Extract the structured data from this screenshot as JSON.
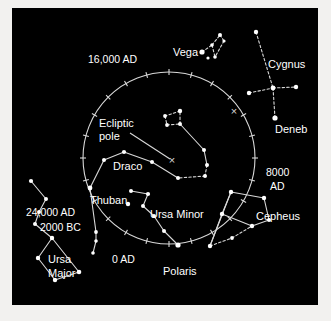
{
  "figure": {
    "type": "sky-chart",
    "title_visible": false,
    "background_color": "#000000",
    "frame_color": "#f2f1ef",
    "line_color": "#d8d8d8",
    "star_color": "#ffffff",
    "label_color": "#ffffff"
  },
  "precession_circle": {
    "name": "precession-circle",
    "center": [
      169,
      158
    ],
    "radius": 86,
    "tick_count": 24,
    "tick_length": 6
  },
  "epoch_labels": [
    {
      "id": "epoch-16000ad",
      "text": "16,000 AD",
      "x": 88,
      "y": 53,
      "align": "left"
    },
    {
      "id": "epoch-8000ad",
      "text": "8000",
      "x": 266,
      "y": 166,
      "align": "left"
    },
    {
      "id": "epoch-8000ad2",
      "text": "AD",
      "x": 270,
      "y": 180,
      "align": "left"
    },
    {
      "id": "epoch-24000ad",
      "text": "24,000 AD",
      "x": 26,
      "y": 206,
      "align": "left"
    },
    {
      "id": "epoch-2000bc",
      "text": "2000 BC",
      "x": 40,
      "y": 221,
      "align": "left"
    },
    {
      "id": "epoch-0ad",
      "text": "0 AD",
      "x": 112,
      "y": 253,
      "align": "left"
    }
  ],
  "annotations": [
    {
      "id": "ecliptic-pole-line1",
      "text": "Ecliptic",
      "x": 99,
      "y": 117
    },
    {
      "id": "ecliptic-pole-line2",
      "text": "pole",
      "x": 99,
      "y": 130
    },
    {
      "id": "marker-ecliptic-pole",
      "symbol": "×",
      "x": 172,
      "y": 160
    },
    {
      "id": "marker-cross-upper-right",
      "symbol": "×",
      "x": 234,
      "y": 111
    }
  ],
  "star_labels": [
    {
      "id": "label-vega",
      "text": "Vega",
      "x": 173,
      "y": 46
    },
    {
      "id": "label-cygnus",
      "text": "Cygnus",
      "x": 268,
      "y": 58
    },
    {
      "id": "label-deneb",
      "text": "Deneb",
      "x": 275,
      "y": 123
    },
    {
      "id": "label-draco",
      "text": "Draco",
      "x": 113,
      "y": 160
    },
    {
      "id": "label-thuban",
      "text": "Thuban",
      "x": 90,
      "y": 194
    },
    {
      "id": "label-ursa-minor",
      "text": "Ursa Minor",
      "x": 150,
      "y": 208
    },
    {
      "id": "label-cepheus",
      "text": "Cepheus",
      "x": 256,
      "y": 210
    },
    {
      "id": "label-ursa-major1",
      "text": "Ursa",
      "x": 48,
      "y": 253
    },
    {
      "id": "label-ursa-major2",
      "text": "Major",
      "x": 48,
      "y": 267
    },
    {
      "id": "label-polaris",
      "text": "Polaris",
      "x": 163,
      "y": 265
    }
  ],
  "constellations": [
    {
      "name": "lyra",
      "label": "Vega",
      "stars": [
        {
          "id": "vega",
          "x": 202,
          "y": 52,
          "r": 2.6,
          "name": "Vega"
        },
        {
          "id": "lyra-b",
          "x": 208,
          "y": 58,
          "r": 1.6
        },
        {
          "id": "lyra-c",
          "x": 212,
          "y": 45,
          "r": 1.8
        },
        {
          "id": "lyra-d",
          "x": 215,
          "y": 57,
          "r": 1.8
        },
        {
          "id": "lyra-e",
          "x": 220,
          "y": 35,
          "r": 2.0
        },
        {
          "id": "lyra-f",
          "x": 224,
          "y": 41,
          "r": 1.6
        }
      ],
      "segments": [
        {
          "from": "vega",
          "to": "lyra-c",
          "style": "dashed"
        },
        {
          "from": "lyra-c",
          "to": "lyra-d",
          "style": "dashed"
        },
        {
          "from": "lyra-c",
          "to": "lyra-e",
          "style": "dashed"
        },
        {
          "from": "lyra-e",
          "to": "lyra-f",
          "style": "dashed"
        },
        {
          "from": "lyra-f",
          "to": "lyra-d",
          "style": "dashed"
        }
      ]
    },
    {
      "name": "cygnus",
      "label": "Cygnus",
      "stars": [
        {
          "id": "cyg-top",
          "x": 256,
          "y": 32,
          "r": 2.2
        },
        {
          "id": "cyg-mid",
          "x": 273,
          "y": 88,
          "r": 2.4
        },
        {
          "id": "cyg-left",
          "x": 249,
          "y": 93,
          "r": 2.2
        },
        {
          "id": "cyg-right",
          "x": 296,
          "y": 87,
          "r": 2.2
        },
        {
          "id": "deneb",
          "x": 275,
          "y": 118,
          "r": 2.6,
          "name": "Deneb"
        }
      ],
      "segments": [
        {
          "from": "cyg-top",
          "to": "cyg-mid",
          "style": "dashed"
        },
        {
          "from": "cyg-mid",
          "to": "deneb",
          "style": "dashed"
        },
        {
          "from": "cyg-left",
          "to": "cyg-mid",
          "style": "dashed"
        },
        {
          "from": "cyg-mid",
          "to": "cyg-right",
          "style": "dashed"
        }
      ]
    },
    {
      "name": "draco",
      "label": "Draco",
      "stars": [
        {
          "id": "dra-head-a",
          "x": 180,
          "y": 111,
          "r": 2.2
        },
        {
          "id": "dra-head-b",
          "x": 165,
          "y": 116,
          "r": 1.9
        },
        {
          "id": "dra-head-c",
          "x": 167,
          "y": 125,
          "r": 1.9
        },
        {
          "id": "dra-head-d",
          "x": 180,
          "y": 124,
          "r": 2.0
        },
        {
          "id": "dra-e",
          "x": 204,
          "y": 150,
          "r": 2.0
        },
        {
          "id": "dra-f",
          "x": 207,
          "y": 165,
          "r": 2.0
        },
        {
          "id": "dra-g",
          "x": 205,
          "y": 176,
          "r": 2.0
        },
        {
          "id": "dra-h",
          "x": 178,
          "y": 178,
          "r": 2.0
        },
        {
          "id": "dra-i",
          "x": 152,
          "y": 162,
          "r": 2.0
        },
        {
          "id": "dra-j",
          "x": 124,
          "y": 152,
          "r": 2.1
        },
        {
          "id": "dra-k",
          "x": 104,
          "y": 160,
          "r": 2.0
        },
        {
          "id": "thuban",
          "x": 90,
          "y": 188,
          "r": 2.4,
          "name": "Thuban"
        },
        {
          "id": "dra-m",
          "x": 96,
          "y": 232,
          "r": 1.9
        },
        {
          "id": "dra-n",
          "x": 96,
          "y": 241,
          "r": 1.8
        },
        {
          "id": "dra-o",
          "x": 93,
          "y": 253,
          "r": 1.8
        }
      ],
      "segments": [
        {
          "from": "dra-head-a",
          "to": "dra-head-b",
          "style": "dashed"
        },
        {
          "from": "dra-head-b",
          "to": "dra-head-c",
          "style": "dashed"
        },
        {
          "from": "dra-head-c",
          "to": "dra-head-d",
          "style": "dashed"
        },
        {
          "from": "dra-head-d",
          "to": "dra-head-a",
          "style": "dashed"
        },
        {
          "from": "dra-head-d",
          "to": "dra-e",
          "style": "solid"
        },
        {
          "from": "dra-e",
          "to": "dra-f",
          "style": "solid"
        },
        {
          "from": "dra-f",
          "to": "dra-g",
          "style": "dashed"
        },
        {
          "from": "dra-g",
          "to": "dra-h",
          "style": "dashed"
        },
        {
          "from": "dra-h",
          "to": "dra-i",
          "style": "solid"
        },
        {
          "from": "dra-i",
          "to": "dra-j",
          "style": "solid"
        },
        {
          "from": "dra-j",
          "to": "dra-k",
          "style": "solid"
        },
        {
          "from": "dra-k",
          "to": "thuban",
          "style": "solid"
        },
        {
          "from": "thuban",
          "to": "dra-m",
          "style": "solid"
        },
        {
          "from": "dra-m",
          "to": "dra-n",
          "style": "solid"
        },
        {
          "from": "dra-n",
          "to": "dra-o",
          "style": "solid"
        }
      ]
    },
    {
      "name": "ursa-minor",
      "label": "Ursa Minor",
      "stars": [
        {
          "id": "umi-a",
          "x": 131,
          "y": 191,
          "r": 2.0
        },
        {
          "id": "umi-b",
          "x": 148,
          "y": 194,
          "r": 2.1
        },
        {
          "id": "umi-c",
          "x": 128,
          "y": 204,
          "r": 2.2
        },
        {
          "id": "umi-d",
          "x": 143,
          "y": 206,
          "r": 2.0
        },
        {
          "id": "umi-e",
          "x": 154,
          "y": 216,
          "r": 2.0
        },
        {
          "id": "umi-f",
          "x": 164,
          "y": 231,
          "r": 2.0
        },
        {
          "id": "polaris",
          "x": 178,
          "y": 245,
          "r": 2.6,
          "name": "Polaris"
        }
      ],
      "segments": [
        {
          "from": "umi-a",
          "to": "umi-b",
          "style": "solid"
        },
        {
          "from": "umi-b",
          "to": "umi-d",
          "style": "solid"
        },
        {
          "from": "umi-d",
          "to": "umi-e",
          "style": "solid"
        },
        {
          "from": "umi-e",
          "to": "umi-f",
          "style": "solid"
        },
        {
          "from": "umi-f",
          "to": "polaris",
          "style": "solid"
        }
      ]
    },
    {
      "name": "ursa-major",
      "label": "Ursa Major",
      "stars": [
        {
          "id": "uma-a",
          "x": 31,
          "y": 181,
          "r": 2.1
        },
        {
          "id": "uma-b",
          "x": 46,
          "y": 199,
          "r": 2.0
        },
        {
          "id": "uma-c",
          "x": 39,
          "y": 212,
          "r": 2.0
        },
        {
          "id": "uma-d",
          "x": 35,
          "y": 224,
          "r": 2.0
        },
        {
          "id": "uma-e",
          "x": 52,
          "y": 238,
          "r": 2.2
        },
        {
          "id": "uma-f",
          "x": 38,
          "y": 258,
          "r": 2.2
        },
        {
          "id": "uma-g",
          "x": 55,
          "y": 280,
          "r": 2.2
        },
        {
          "id": "uma-h",
          "x": 79,
          "y": 272,
          "r": 2.3
        }
      ],
      "segments": [
        {
          "from": "uma-a",
          "to": "uma-b",
          "style": "solid"
        },
        {
          "from": "uma-b",
          "to": "uma-c",
          "style": "solid"
        },
        {
          "from": "uma-c",
          "to": "uma-d",
          "style": "solid"
        },
        {
          "from": "uma-d",
          "to": "uma-e",
          "style": "solid"
        },
        {
          "from": "uma-e",
          "to": "uma-f",
          "style": "solid"
        },
        {
          "from": "uma-f",
          "to": "uma-g",
          "style": "solid"
        },
        {
          "from": "uma-g",
          "to": "uma-h",
          "style": "solid"
        },
        {
          "from": "uma-h",
          "to": "uma-e",
          "style": "solid"
        }
      ]
    },
    {
      "name": "cepheus",
      "label": "Cepheus",
      "stars": [
        {
          "id": "cep-a",
          "x": 231,
          "y": 192,
          "r": 2.2
        },
        {
          "id": "cep-b",
          "x": 264,
          "y": 198,
          "r": 2.2
        },
        {
          "id": "cep-c",
          "x": 222,
          "y": 214,
          "r": 2.2
        },
        {
          "id": "cep-d",
          "x": 252,
          "y": 226,
          "r": 2.2
        },
        {
          "id": "cep-e",
          "x": 269,
          "y": 220,
          "r": 2.0
        },
        {
          "id": "cep-f",
          "x": 210,
          "y": 246,
          "r": 2.2
        },
        {
          "id": "cep-g",
          "x": 232,
          "y": 238,
          "r": 1.9
        }
      ],
      "segments": [
        {
          "from": "cep-a",
          "to": "cep-b",
          "style": "solid"
        },
        {
          "from": "cep-b",
          "to": "cep-e",
          "style": "solid"
        },
        {
          "from": "cep-e",
          "to": "cep-d",
          "style": "solid"
        },
        {
          "from": "cep-a",
          "to": "cep-c",
          "style": "solid"
        },
        {
          "from": "cep-c",
          "to": "cep-d",
          "style": "solid"
        },
        {
          "from": "cep-c",
          "to": "cep-f",
          "style": "solid"
        },
        {
          "from": "cep-a",
          "to": "cep-f",
          "style": "solid"
        },
        {
          "from": "cep-f",
          "to": "cep-g",
          "style": "dashed"
        },
        {
          "from": "cep-g",
          "to": "cep-d",
          "style": "dashed"
        }
      ]
    }
  ],
  "leader_lines": [
    {
      "id": "ecliptic-pole-leader",
      "from": [
        130,
        133
      ],
      "to": [
        170,
        159
      ]
    }
  ]
}
